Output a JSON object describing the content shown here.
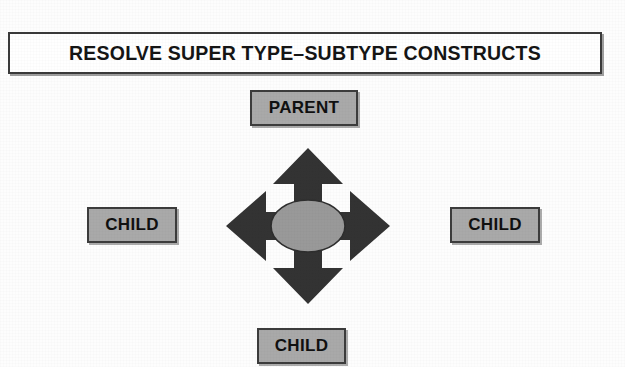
{
  "diagram": {
    "title": "RESOLVE SUPER TYPE–SUBTYPE CONSTRUCTS",
    "background_color": "#fdfdfd",
    "nodes": [
      {
        "id": "parent",
        "label": "PARENT",
        "role": "supertype",
        "position": "top",
        "fill_color": "#a9a9a9",
        "border_color": "#3c3c3c"
      },
      {
        "id": "child-left",
        "label": "CHILD",
        "role": "subtype",
        "position": "left",
        "fill_color": "#a9a9a9",
        "border_color": "#3c3c3c"
      },
      {
        "id": "child-right",
        "label": "CHILD",
        "role": "subtype",
        "position": "right",
        "fill_color": "#a9a9a9",
        "border_color": "#3c3c3c"
      },
      {
        "id": "child-bottom",
        "label": "CHILD",
        "role": "subtype",
        "position": "bottom",
        "fill_color": "#a9a9a9",
        "border_color": "#3c3c3c"
      }
    ],
    "connector": {
      "name": "four-way-arrow",
      "arrow_color": "#333333",
      "hub_shape": "ellipse",
      "hub_fill_color": "#999999",
      "hub_border_color": "#2e2e2e",
      "directions": [
        "up",
        "down",
        "left",
        "right"
      ]
    },
    "title_box": {
      "fill_color": "#ffffff",
      "border_color": "#3a3a3a",
      "text_color": "#151515"
    }
  }
}
